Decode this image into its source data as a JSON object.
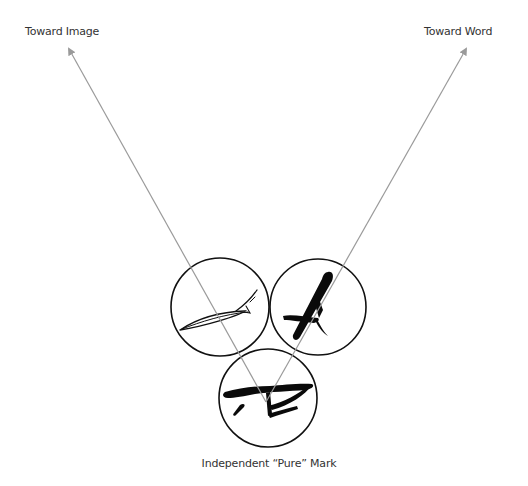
{
  "labels": {
    "toward_image": "Toward Image",
    "toward_word": "Toward Word",
    "pure_mark": "Independent “Pure” Mark"
  },
  "colors": {
    "arrow": "#9a9a9a",
    "circle": "#111111",
    "ink": "#0a0a0a",
    "text": "#333333"
  },
  "nodes": [
    {
      "id": "image-mark",
      "description": "fish-like sketched line mark",
      "cx": 220,
      "cy": 307,
      "r": 49
    },
    {
      "id": "word-mark",
      "description": "brush-stroke letter A",
      "cx": 318,
      "cy": 307,
      "r": 48
    },
    {
      "id": "pure-mark",
      "description": "abstract brush-stroke mark",
      "cx": 268,
      "cy": 398,
      "r": 49
    }
  ],
  "arrows": [
    {
      "id": "to-image",
      "from": [
        266,
        402
      ],
      "to": [
        68,
        47
      ]
    },
    {
      "id": "to-word",
      "from": [
        266,
        402
      ],
      "to": [
        467,
        47
      ]
    }
  ]
}
